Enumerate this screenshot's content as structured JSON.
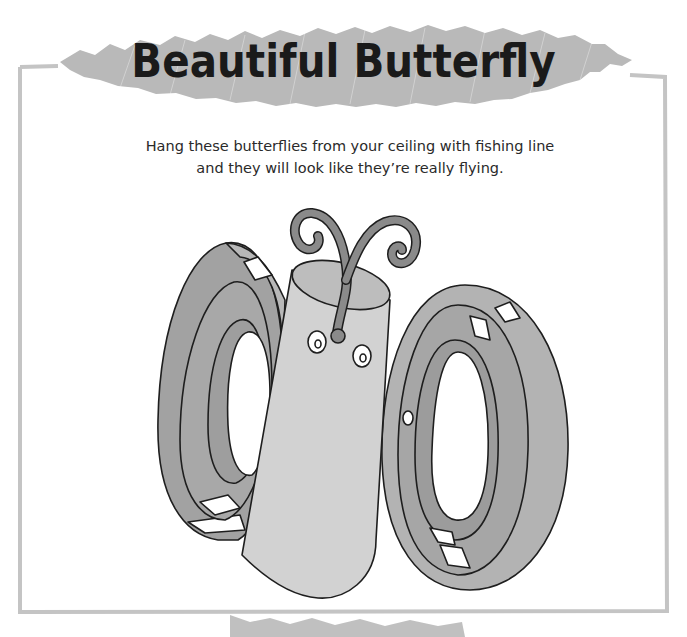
{
  "page": {
    "title": "Beautiful Butterfly",
    "intro_lines": [
      "Hang these butterflies from your ceiling with fishing line",
      "and they will look like they’re really flying."
    ]
  },
  "illustration": {
    "subject": "toilet-paper-tube butterfly with paper-strip loop wings and pipe-cleaner antennae",
    "parts": [
      "body-tube",
      "left-wing-loops",
      "right-wing-loops",
      "antennae",
      "eyes",
      "nose"
    ]
  },
  "colors": {
    "banner_scribble": "#b9b9b9",
    "frame_border": "#c4c4c4",
    "title_text": "#1a1a1a",
    "body_tube": "#d2d2d2",
    "body_top": "#bdbdbd",
    "wing_light": "#b3b3b3",
    "wing_dark": "#9a9a9a",
    "antenna": "#8a8a8a",
    "outline": "#1e1e1e"
  }
}
